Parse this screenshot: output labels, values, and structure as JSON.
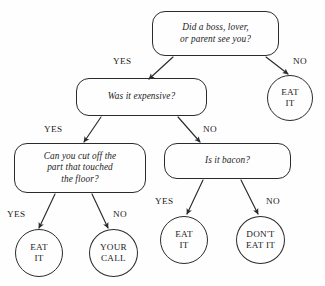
{
  "diagram": {
    "style": {
      "background": "#fefefe",
      "ink": "#2b2b2b",
      "text": "#1c1c1c"
    },
    "nodes": [
      {
        "id": "q-seen",
        "kind": "decision",
        "text": "Did a boss, lover,\nor parent see you?",
        "x": 152,
        "y": 11,
        "w": 127,
        "h": 45
      },
      {
        "id": "q-expensive",
        "kind": "decision",
        "text": "Was it expensive?",
        "x": 76,
        "y": 78,
        "w": 131,
        "h": 38
      },
      {
        "id": "q-cut-off",
        "kind": "decision",
        "text": "Can you cut off the\npart that touched\nthe floor?",
        "x": 14,
        "y": 143,
        "w": 132,
        "h": 50
      },
      {
        "id": "q-bacon",
        "kind": "decision",
        "text": "Is it bacon?",
        "x": 164,
        "y": 143,
        "w": 127,
        "h": 36
      },
      {
        "id": "r-eat-it-top",
        "kind": "terminal",
        "text": "EAT\nIT",
        "x": 267,
        "y": 75,
        "w": 46,
        "h": 46
      },
      {
        "id": "r-eat-it-left",
        "kind": "terminal",
        "text": "EAT\nIT",
        "x": 15,
        "y": 229,
        "w": 48,
        "h": 48
      },
      {
        "id": "r-your-call",
        "kind": "terminal",
        "text": "YOUR\nCALL",
        "x": 89,
        "y": 229,
        "w": 49,
        "h": 48
      },
      {
        "id": "r-eat-it-right",
        "kind": "terminal",
        "text": "EAT\nIT",
        "x": 160,
        "y": 216,
        "w": 48,
        "h": 48
      },
      {
        "id": "r-dont-eat-it",
        "kind": "terminal",
        "text": "DON'T\nEAT IT",
        "x": 236,
        "y": 216,
        "w": 49,
        "h": 48
      }
    ],
    "edges": [
      {
        "id": "e-seen-yes",
        "from": "q-seen",
        "to": "q-expensive",
        "label": "YES",
        "path": "M 173 57 L 149 79"
      },
      {
        "id": "e-seen-no",
        "from": "q-seen",
        "to": "r-eat-it-top",
        "label": "NO",
        "path": "M 266 57 L 288 74"
      },
      {
        "id": "e-expensive-yes",
        "from": "q-expensive",
        "to": "q-cut-off",
        "label": "YES",
        "path": "M 101 117 L 84 142"
      },
      {
        "id": "e-expensive-no",
        "from": "q-expensive",
        "to": "q-bacon",
        "label": "NO",
        "path": "M 178 117 L 200 142"
      },
      {
        "id": "e-cut-yes",
        "from": "q-cut-off",
        "to": "r-eat-it-left",
        "label": "YES",
        "path": "M 55 194 L 39 228"
      },
      {
        "id": "e-cut-no",
        "from": "q-cut-off",
        "to": "r-your-call",
        "label": "NO",
        "path": "M 92 194 L 108 228"
      },
      {
        "id": "e-bacon-yes",
        "from": "q-bacon",
        "to": "r-eat-it-right",
        "label": "YES",
        "path": "M 203 180 L 187 214"
      },
      {
        "id": "e-bacon-no",
        "from": "q-bacon",
        "to": "r-dont-eat-it",
        "label": "NO",
        "path": "M 241 180 L 258 214"
      }
    ],
    "edge_labels": [
      {
        "id": "lbl-seen-yes",
        "text": "YES",
        "x": 113,
        "y": 56
      },
      {
        "id": "lbl-seen-no",
        "text": "NO",
        "x": 293,
        "y": 56
      },
      {
        "id": "lbl-expensive-yes",
        "text": "YES",
        "x": 44,
        "y": 124
      },
      {
        "id": "lbl-expensive-no",
        "text": "NO",
        "x": 203,
        "y": 124
      },
      {
        "id": "lbl-cut-yes",
        "text": "YES",
        "x": 7,
        "y": 209
      },
      {
        "id": "lbl-cut-no",
        "text": "NO",
        "x": 113,
        "y": 209
      },
      {
        "id": "lbl-bacon-yes",
        "text": "YES",
        "x": 155,
        "y": 196
      },
      {
        "id": "lbl-bacon-no",
        "text": "NO",
        "x": 266,
        "y": 196
      }
    ]
  }
}
